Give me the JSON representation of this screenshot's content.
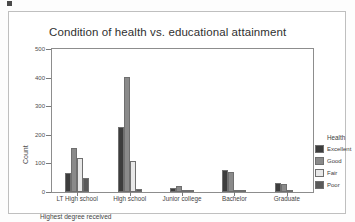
{
  "chart_data": {
    "type": "bar",
    "title": "Condition of health vs. educational attainment",
    "xlabel": "Highest degree received",
    "ylabel": "Count",
    "ylim": [
      0,
      500
    ],
    "yticks": [
      0,
      100,
      200,
      300,
      400,
      500
    ],
    "grid": false,
    "legend_position": "right",
    "legend_title": "Health",
    "categories": [
      "LT High school",
      "High school",
      "Junior college",
      "Bachelor",
      "Graduate"
    ],
    "series": [
      {
        "name": "Excellent",
        "color": "#3d3d3d",
        "values": [
          65,
          228,
          15,
          78,
          32
        ]
      },
      {
        "name": "Good",
        "color": "#8a8a8a",
        "values": [
          155,
          402,
          22,
          70,
          28
        ]
      },
      {
        "name": "Fair",
        "color": "#e8e8e8",
        "values": [
          120,
          110,
          5,
          8,
          3
        ]
      },
      {
        "name": "Poor",
        "color": "#5a5a5a",
        "values": [
          48,
          12,
          2,
          1,
          0
        ]
      }
    ]
  },
  "chart": {
    "title": "Condition of health vs. educational attainment",
    "y_axis_title": "Count",
    "x_axis_title": "Highest degree received"
  },
  "legend": {
    "title": "Health"
  }
}
